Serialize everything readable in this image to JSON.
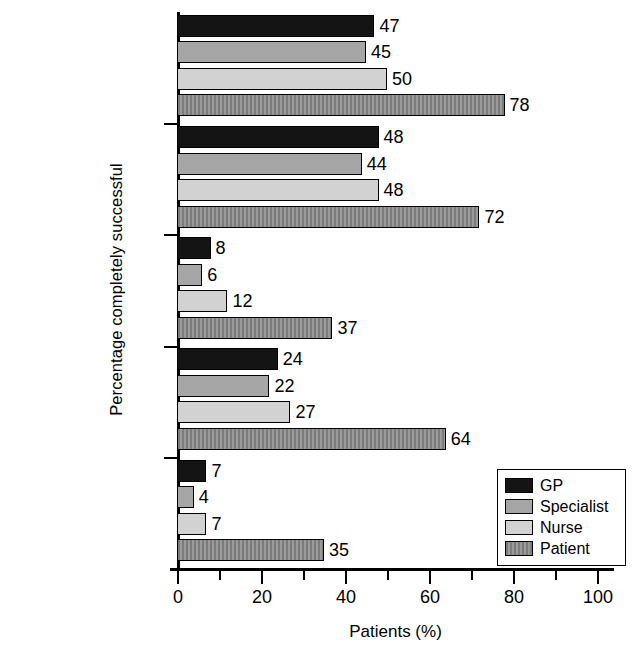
{
  "chart_data": {
    "type": "bar",
    "orientation": "horizontal",
    "title": "",
    "xlabel": "Patients (%)",
    "ylabel": "Percentage completely successful",
    "xlim": [
      0,
      100
    ],
    "xticks": [
      0,
      20,
      40,
      60,
      80,
      100
    ],
    "xtick_labels": [
      "0",
      "20",
      "40",
      "60",
      "80",
      "100"
    ],
    "xminor_ticks": [
      10,
      30,
      50,
      70,
      90
    ],
    "grid": false,
    "legend_position": "bottom-right",
    "categories": [
      "Taking medication",
      "Keeping appointments",
      "Diet",
      "Self-testing",
      "Exercise"
    ],
    "category_lines": [
      [
        "Taking",
        "medication"
      ],
      [
        "Keeping",
        "appointments"
      ],
      [
        "Diet"
      ],
      [
        "Self-testing"
      ],
      [
        "Exercise"
      ]
    ],
    "series": [
      {
        "name": "GP",
        "color": "#141414",
        "values": [
          47,
          48,
          8,
          24,
          7
        ]
      },
      {
        "name": "Specialist",
        "color": "#a6a6a6",
        "values": [
          45,
          44,
          6,
          22,
          4
        ]
      },
      {
        "name": "Nurse",
        "color": "#d2d2d2",
        "values": [
          50,
          48,
          12,
          27,
          7
        ]
      },
      {
        "name": "Patient",
        "color": "#8c8c8c",
        "values": [
          78,
          72,
          37,
          64,
          35
        ]
      }
    ]
  }
}
